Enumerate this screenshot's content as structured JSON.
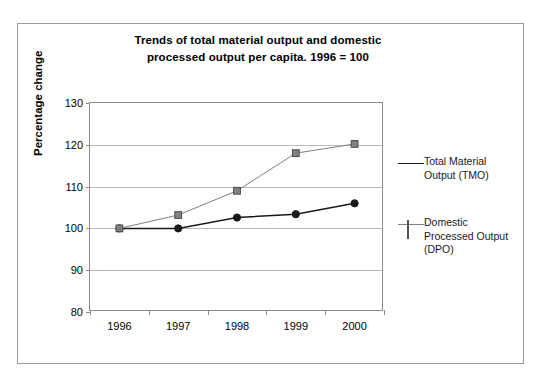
{
  "chart_data": {
    "type": "line",
    "title": "Trends of total material output and domestic processed output per capita. 1996 = 100",
    "title_line1": "Trends of total material output and domestic",
    "title_line2": "processed output per capita. 1996 = 100",
    "xlabel": "",
    "ylabel": "Percentage change",
    "categories": [
      "1996",
      "1997",
      "1998",
      "1999",
      "2000"
    ],
    "ylim": [
      80,
      130
    ],
    "yticks": [
      80,
      90,
      100,
      110,
      120,
      130
    ],
    "grid": true,
    "legend_position": "right",
    "series": [
      {
        "name": "Total Material Output (TMO)",
        "name_line1": "Total Material",
        "name_line2": "Output (TMO)",
        "marker": "circle",
        "color": "#1a1a1a",
        "values": [
          100,
          100,
          102.6,
          103.4,
          106
        ]
      },
      {
        "name": "Domestic Processed Output (DPO)",
        "name_line1": "Domestic",
        "name_line2": "Processed Output",
        "name_line3": "(DPO)",
        "marker": "square",
        "color": "#808080",
        "values": [
          100,
          103.2,
          109,
          118,
          120.2
        ]
      }
    ]
  },
  "colors": {
    "tmo": "#1a1a1a",
    "dpo": "#808080",
    "gridline": "#b9b9b9",
    "axis": "#8c8c8c",
    "frame": "#9a9a9a",
    "text": "#000000"
  }
}
